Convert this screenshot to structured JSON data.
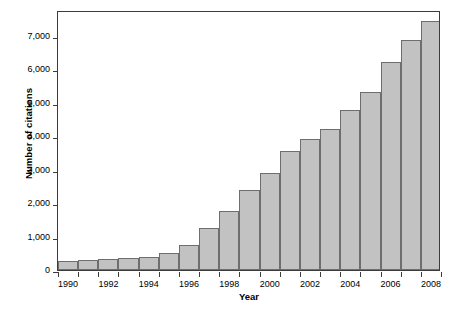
{
  "chart_data": {
    "type": "bar",
    "title": "",
    "xlabel": "Year",
    "ylabel": "Number of citations",
    "categories": [
      1990,
      1991,
      1992,
      1993,
      1994,
      1995,
      1996,
      1997,
      1998,
      1999,
      2000,
      2001,
      2002,
      2003,
      2004,
      2005,
      2006,
      2007,
      2008
    ],
    "values": [
      270,
      290,
      315,
      345,
      390,
      520,
      750,
      1250,
      1780,
      2380,
      2890,
      3560,
      3930,
      4220,
      4800,
      5340,
      6210,
      6870,
      7450
    ],
    "xtick_labels": [
      "1990",
      "1992",
      "1994",
      "1996",
      "1998",
      "2000",
      "2002",
      "2004",
      "2006",
      "2008"
    ],
    "xtick_values": [
      1990,
      1992,
      1994,
      1996,
      1998,
      2000,
      2002,
      2004,
      2006,
      2008
    ],
    "ytick_labels": [
      "0",
      "1,000",
      "2,000",
      "3,000",
      "4,000",
      "5,000",
      "6,000",
      "7,000"
    ],
    "ytick_values": [
      0,
      1000,
      2000,
      3000,
      4000,
      5000,
      6000,
      7000
    ],
    "ylim": [
      0,
      7780
    ],
    "grid": false,
    "legend": false,
    "bar_color": "#c2c2c2",
    "bar_edge_color": "#6e6e6e",
    "axis_color": "#3c3c3c",
    "background_color": "#ffffff"
  }
}
